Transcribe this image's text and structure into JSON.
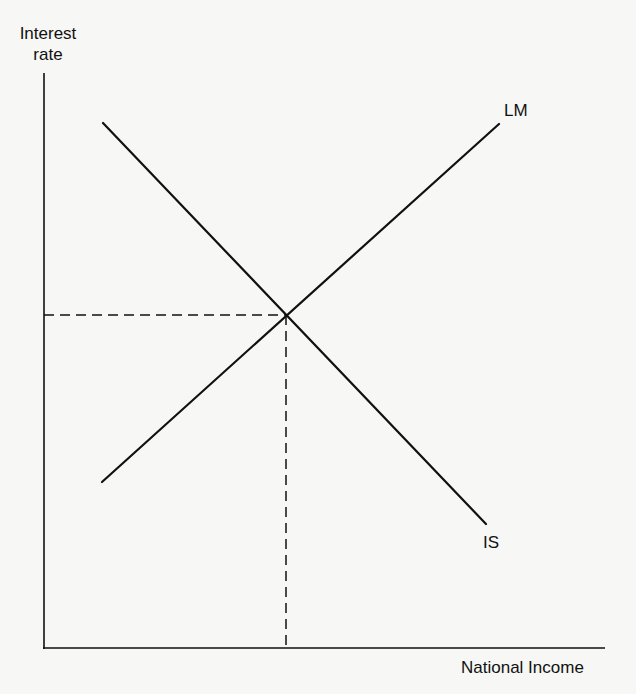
{
  "diagram": {
    "y_axis_label_line1": "Interest",
    "y_axis_label_line2": "rate",
    "x_axis_label": "National Income",
    "curves": [
      {
        "name": "LM",
        "label": "LM",
        "slope": "upward",
        "from": [
          102,
          482
        ],
        "to": [
          499,
          124
        ]
      },
      {
        "name": "IS",
        "label": "IS",
        "slope": "downward",
        "from": [
          103,
          123
        ],
        "to": [
          486,
          524
        ]
      }
    ],
    "equilibrium": {
      "x": 286,
      "y": 315,
      "guides": "dashed lines to both axes"
    },
    "colors": {
      "ink": "#111111",
      "background": "#f7f7f5"
    }
  }
}
